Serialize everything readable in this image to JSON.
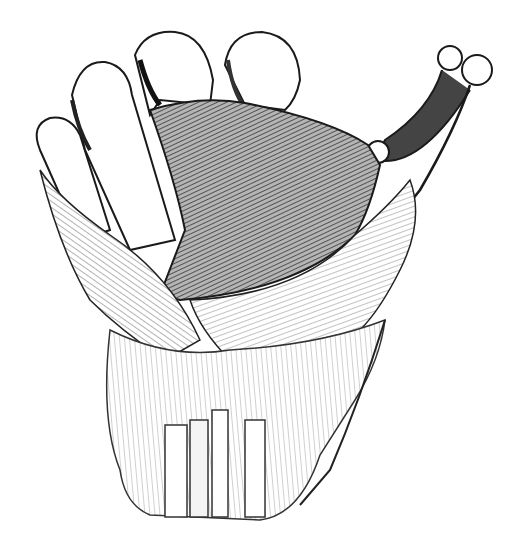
{
  "image": {
    "subject": "Anatomical engraving of a hand skeleton with palmar ligaments and hatched membrane",
    "style": "black-and-white engraving",
    "colors": {
      "background": "#ffffff",
      "ink": "#1a1a1a",
      "membrane_fill": "#8c8c8c",
      "shade": "#555555"
    },
    "labels": []
  }
}
